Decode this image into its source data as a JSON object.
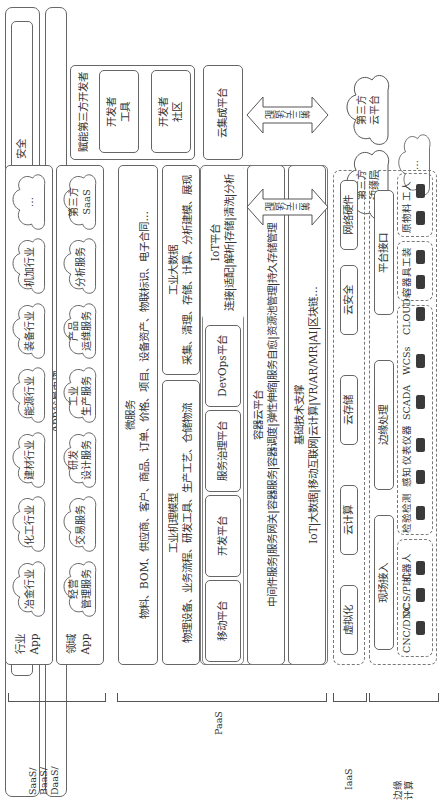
{
  "top": {
    "security": "安全",
    "standard": "标准",
    "app_market": "App交易市场"
  },
  "developer": {
    "title": "赋能第三方开发者",
    "community": "开发者社区",
    "tools": "开发者工具"
  },
  "saas": {
    "row1_label": "行业\nApp",
    "row1_items": [
      "冶金行业",
      "化工行业",
      "建材行业",
      "能源行业",
      "装备行业",
      "机加行业",
      "…"
    ],
    "row2_label": "领域\nApp",
    "row2_items": [
      "经营\n管理服务",
      "交易服务",
      "研发\n设计服务",
      "工业\n生产服务",
      "产品\n运维服务",
      "分析服务",
      "第三方\nSaaS"
    ]
  },
  "paas": {
    "microservice_title": "微服务",
    "microservice_text": "物料、BOM、供应商、客户、商品、订单、价格、项目、设备资产、物联标识、电子合同…",
    "mechanism_title": "工业机理模型",
    "mechanism_text": "物理设备、业务流程、研发工具、生产工艺、仓储物流",
    "bigdata_title": "工业大数据",
    "bigdata_text": "采集、清理、存储、计算、分析建模、展现",
    "platforms": [
      "移动平台",
      "开发平台",
      "服务治理平台",
      "DevOps平台"
    ],
    "iot_title": "IoT平台",
    "iot_text": "连接|适配|解析|存储|清洗|分析",
    "container_title": "容器云平台",
    "container_text": "中间件服务|服务网关|容器服务|容器调度|弹性伸缩|服务自愈|资源池管理|持久存储管理",
    "basetech_title": "基础技术支撑",
    "basetech_text": "IoT|大数据|移动互联网|云计算|VR/AR/MR|AI|区块链…"
  },
  "integration": {
    "cloud_integration": "云集成平台",
    "adapter1": "第三方适配",
    "adapter2": "第三方适配",
    "cloud_platform": "第三方\n云平台",
    "edge_layer": "第三方\n边缘层",
    "more": "…"
  },
  "iaas": {
    "items": [
      "虚拟化",
      "云计算",
      "云存储",
      "云安全",
      "网络硬件"
    ]
  },
  "edge": {
    "field_access": "现场接入",
    "edge_processing": "边缘处理",
    "platform_interface": "平台接口",
    "devices": [
      "CNC/DNC",
      "DCS/PLC",
      "机器人",
      "检验检测",
      "感知",
      "仪表仪器",
      "SCADA",
      "WCSs",
      "CLOUDs",
      "容器具",
      "工装",
      "原物料",
      "工人"
    ]
  },
  "layer_labels": {
    "saas": "SaaS/\nBaaS/\nDaaS/",
    "paas": "PaaS",
    "iaas": "IaaS",
    "edge": "边缘\n计算"
  }
}
